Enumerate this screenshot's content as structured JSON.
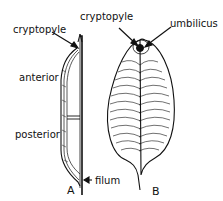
{
  "figure": {
    "panel_a": {
      "letter": "A",
      "labels": {
        "cryptopyle": "cryptopyle",
        "anterior": "anterior",
        "posterior": "posterior"
      }
    },
    "panel_b": {
      "letter": "B",
      "labels": {
        "cryptopyle": "cryptopyle",
        "umbilicus": "umbilicus",
        "filum": "filum"
      }
    },
    "colors": {
      "ink": "#111111",
      "background": "#ffffff"
    }
  }
}
